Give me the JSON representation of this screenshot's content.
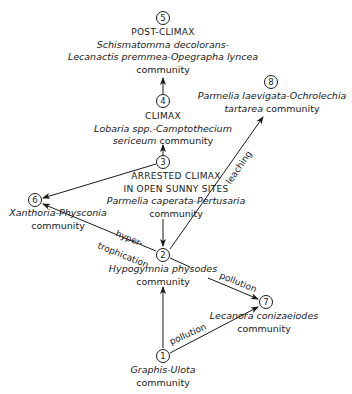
{
  "nodes": {
    "n1": {
      "num": "1",
      "species": "Graphis-Ulota",
      "suffix": "community"
    },
    "n2": {
      "num": "2",
      "species": "Hypogymnia physodes",
      "suffix": "community"
    },
    "n3": {
      "num": "3",
      "stage1": "ARRESTED CLIMAX",
      "stage2": "IN OPEN SUNNY SITES",
      "species": "Parmelia caperata-Pertusaria",
      "suffix": "community"
    },
    "n4": {
      "num": "4",
      "stage": "CLIMAX",
      "species1": "Lobaria spp.-Camptothecium",
      "species2": "sericeum",
      "suffix": "community"
    },
    "n5": {
      "num": "5",
      "stage": "POST-CLIMAX",
      "species1": "Schismatomma decolorans-",
      "species2": "Lecanactis premmea-Opegrapha lyncea",
      "suffix": "community"
    },
    "n6": {
      "num": "6",
      "species": "Xanthoria-Physconia",
      "suffix": "community"
    },
    "n7": {
      "num": "7",
      "species": "Lecanora conizaeiodes",
      "suffix": "community"
    },
    "n8": {
      "num": "8",
      "species1": "Parmelia laevigata-Ochrolechia",
      "species2": "tartarea",
      "suffix": "community"
    }
  },
  "edges": {
    "leaching": "leaching",
    "hyper": "hyper-",
    "trophication": "trophication",
    "pollution_2_7": "pollution",
    "pollution_1_7": "pollution"
  }
}
